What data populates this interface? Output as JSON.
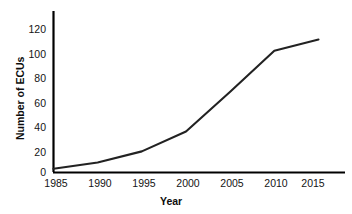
{
  "chart_data": {
    "type": "line",
    "title": "",
    "subtitle": "",
    "xlabel": "Year",
    "ylabel": "Number of ECUs",
    "x": [
      1985,
      1990,
      1995,
      2000,
      2005,
      2010,
      2015
    ],
    "values": [
      3,
      8,
      17,
      33,
      65,
      98,
      107
    ],
    "series": [
      {
        "name": "Number of ECUs",
        "values": [
          3,
          8,
          17,
          33,
          65,
          98,
          107
        ]
      }
    ],
    "xlim": [
      1985,
      2018
    ],
    "ylim": [
      0,
      130
    ],
    "xticks": [
      "1985",
      "1990",
      "1995",
      "2000",
      "2005",
      "2010",
      "2015"
    ],
    "xtick_values": [
      1985,
      1990,
      1995,
      2000,
      2005,
      2010,
      2015
    ],
    "yticks": [
      "0",
      "20",
      "40",
      "60",
      "80",
      "100",
      "120"
    ],
    "ytick_values": [
      0,
      20,
      40,
      60,
      80,
      100,
      120
    ],
    "grid": false,
    "legend": false,
    "legend_position": "none",
    "line_color": "#222222",
    "background_color": "#ffffff",
    "axis_color": "#000000"
  },
  "axes": {
    "x_title": "Year",
    "y_title": "Number of ECUs"
  },
  "ytick_labels": [
    "120",
    "100",
    "80",
    "60",
    "40",
    "20",
    "0"
  ],
  "xtick_labels": [
    "1985",
    "1990",
    "1995",
    "2000",
    "2005",
    "2010",
    "2015"
  ]
}
